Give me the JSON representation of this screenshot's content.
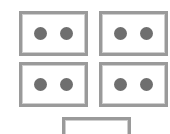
{
  "image": {
    "title": "Dot Cards Grid",
    "background_color": "#ffffff",
    "width": 170,
    "height": 134
  },
  "style": {
    "card_border_color": "#9a9a9a",
    "card_inner_line_color": "#cfcfcf",
    "card_fill_color": "#ffffff",
    "dot_color": "#6f6f6f"
  },
  "cards": [
    {
      "id": "card-top-left",
      "position": "top-left",
      "dot_count": 2,
      "cropped": false,
      "label": "Card with 2 dots"
    },
    {
      "id": "card-top-right",
      "position": "top-right",
      "dot_count": 2,
      "cropped": false,
      "label": "Card with 2 dots"
    },
    {
      "id": "card-bottom-left",
      "position": "bottom-left",
      "dot_count": 2,
      "cropped": false,
      "label": "Card with 2 dots"
    },
    {
      "id": "card-bottom-right",
      "position": "bottom-right",
      "dot_count": 2,
      "cropped": false,
      "label": "Card with 2 dots"
    },
    {
      "id": "card-center-bottom",
      "position": "center-bottom",
      "dot_count": 0,
      "cropped": true,
      "label": "Empty card, cut off at bottom edge"
    }
  ],
  "summary": {
    "total_cards": 5,
    "total_dots": 8
  }
}
